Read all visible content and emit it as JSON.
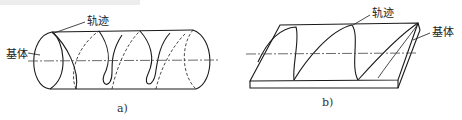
{
  "figure": {
    "panel_a": {
      "caption": "a)",
      "labels": {
        "trajectory": "轨迹",
        "substrate": "基体"
      },
      "shape": "cylinder"
    },
    "panel_b": {
      "caption": "b)",
      "labels": {
        "trajectory": "轨迹",
        "substrate": "基体"
      },
      "shape": "flat-plate"
    }
  },
  "colors": {
    "line": "#1a1a1a",
    "axis": "#444444",
    "background": "#ffffff"
  }
}
